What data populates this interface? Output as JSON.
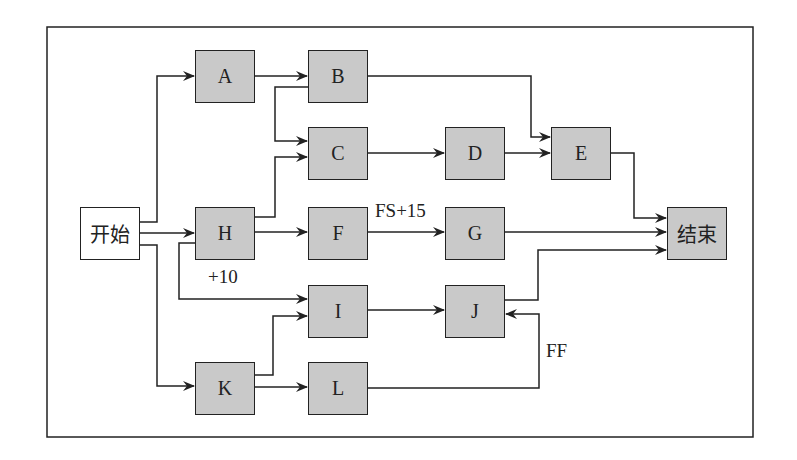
{
  "diagram": {
    "type": "network-diagram",
    "nodes": {
      "start": "开始",
      "A": "A",
      "B": "B",
      "C": "C",
      "D": "D",
      "E": "E",
      "F": "F",
      "G": "G",
      "H": "H",
      "I": "I",
      "J": "J",
      "K": "K",
      "L": "L",
      "end": "结束"
    },
    "edges": [
      {
        "from": "开始",
        "to": "A"
      },
      {
        "from": "开始",
        "to": "H"
      },
      {
        "from": "开始",
        "to": "K"
      },
      {
        "from": "A",
        "to": "B"
      },
      {
        "from": "B",
        "to": "C"
      },
      {
        "from": "B",
        "to": "E"
      },
      {
        "from": "H",
        "to": "C"
      },
      {
        "from": "C",
        "to": "D"
      },
      {
        "from": "D",
        "to": "E"
      },
      {
        "from": "E",
        "to": "结束"
      },
      {
        "from": "H",
        "to": "F"
      },
      {
        "from": "F",
        "to": "G",
        "label": "FS+15"
      },
      {
        "from": "G",
        "to": "结束"
      },
      {
        "from": "H",
        "to": "I",
        "label": "+10"
      },
      {
        "from": "K",
        "to": "I"
      },
      {
        "from": "I",
        "to": "J"
      },
      {
        "from": "J",
        "to": "结束"
      },
      {
        "from": "K",
        "to": "L"
      },
      {
        "from": "L",
        "to": "J",
        "label": "FF"
      }
    ],
    "labels": {
      "fs15": "FS+15",
      "plus10": "+10",
      "ff": "FF"
    }
  }
}
